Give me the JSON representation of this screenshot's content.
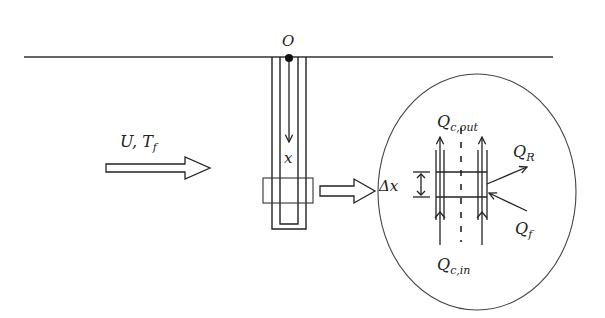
{
  "diagram": {
    "type": "schematic",
    "colors": {
      "stroke": "#222222",
      "background": "#ffffff"
    },
    "labels": {
      "origin": "O",
      "flow": "U, T",
      "flow_sub": "f",
      "depth": "x",
      "delta_x": "Δx",
      "q_out": "Q",
      "q_out_sub": "c,out",
      "q_in": "Q",
      "q_in_sub": "c,in",
      "q_r": "Q",
      "q_r_sub": "R",
      "q_f": "Q",
      "q_f_sub": "f"
    },
    "elements": [
      "ground-surface-line",
      "origin-point",
      "u-tube-pipe",
      "depth-arrow",
      "flow-arrow",
      "control-volume-box",
      "magnify-arrow",
      "detail-ellipse",
      "upflow-arrows",
      "centerline-dashed",
      "heat-flux-arrows"
    ]
  }
}
